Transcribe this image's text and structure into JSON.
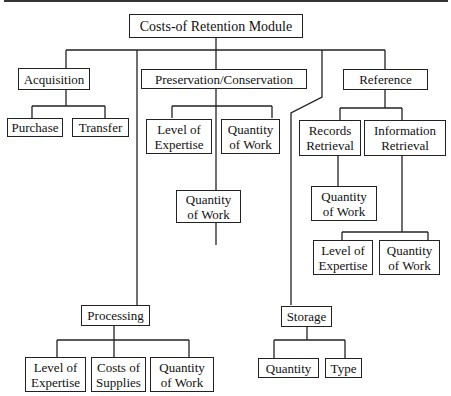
{
  "title": "Costs-of Retention Module",
  "nodes": {
    "root": "Costs-of Retention Module",
    "acquisition": "Acquisition",
    "purchase": "Purchase",
    "transfer": "Transfer",
    "preservation": "Preservation/Conservation",
    "pres_level": "Level of\nExpertise",
    "pres_quantity_right": "Quantity\nof Work",
    "pres_quantity_below": "Quantity\nof Work",
    "reference": "Reference",
    "records_retrieval": "Records\nRetrieval",
    "information_retrieval": "Information\nRetrieval",
    "records_quantity": "Quantity\nof Work",
    "info_level": "Level of\nExpertise",
    "info_quantity": "Quantity\nof Work",
    "processing": "Processing",
    "proc_level": "Level of\nExpertise",
    "proc_costs": "Costs of\nSupplies",
    "proc_quantity": "Quantity\nof Work",
    "storage": "Storage",
    "storage_quantity": "Quantity",
    "storage_type": "Type"
  }
}
